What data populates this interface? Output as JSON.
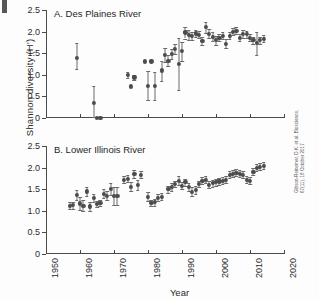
{
  "figure": {
    "ylabel": "Shannon diversity (H')",
    "xlabel": "Year",
    "citation_line1": "Gibson-Reinemer, D.K. et al. Bioscience,",
    "citation_line2": "67(11), 18 October 2017"
  },
  "chart_data": {
    "type": "scatter",
    "title": "",
    "xlabel": "Year",
    "ylabel": "Shannon diversity (H')",
    "xlim": [
      1950,
      2020
    ],
    "ylim": [
      0,
      2.5
    ],
    "xticks": [
      1950,
      1960,
      1970,
      1980,
      1990,
      2000,
      2010,
      2020
    ],
    "xtick_labels": [
      "1950",
      "1960",
      "1970",
      "1980",
      "1990",
      "2000",
      "2010",
      "2020"
    ],
    "yticks": [
      0,
      0.5,
      1.0,
      1.5,
      2.0,
      2.5
    ],
    "ytick_labels": [
      "0",
      "0.5",
      "1.0",
      "1.5",
      "2.0",
      "2.5"
    ],
    "grid": false,
    "legend": "none",
    "error_bars": "vertical, 95% interval",
    "panels": [
      {
        "id": "A",
        "label": "A. Des Plaines River",
        "points": [
          {
            "x": 1959,
            "y": 1.4,
            "lo": 1.13,
            "hi": 1.73
          },
          {
            "x": 1964,
            "y": 0.34,
            "lo": 0.02,
            "hi": 0.74
          },
          {
            "x": 1965,
            "y": 0.01,
            "lo": 0.01,
            "hi": 0.01
          },
          {
            "x": 1966,
            "y": 0.01,
            "lo": 0.01,
            "hi": 0.01
          },
          {
            "x": 1974,
            "y": 1.0,
            "lo": 0.93,
            "hi": 1.07
          },
          {
            "x": 1975,
            "y": 0.73,
            "lo": 0.73,
            "hi": 0.73
          },
          {
            "x": 1976,
            "y": 0.94,
            "lo": 0.88,
            "hi": 1.0
          },
          {
            "x": 1979,
            "y": 1.31,
            "lo": 1.31,
            "hi": 1.31
          },
          {
            "x": 1980,
            "y": 0.75,
            "lo": 0.41,
            "hi": 1.09
          },
          {
            "x": 1981,
            "y": 1.31,
            "lo": 1.31,
            "hi": 1.31
          },
          {
            "x": 1982,
            "y": 0.74,
            "lo": 0.42,
            "hi": 1.06
          },
          {
            "x": 1984,
            "y": 1.1,
            "lo": 0.85,
            "hi": 1.33
          },
          {
            "x": 1985,
            "y": 1.46,
            "lo": 1.3,
            "hi": 1.62
          },
          {
            "x": 1986,
            "y": 1.33,
            "lo": 1.2,
            "hi": 1.46
          },
          {
            "x": 1987,
            "y": 1.48,
            "lo": 1.36,
            "hi": 1.6
          },
          {
            "x": 1988,
            "y": 1.6,
            "lo": 1.48,
            "hi": 1.72
          },
          {
            "x": 1989,
            "y": 1.25,
            "lo": 0.65,
            "hi": 1.85
          },
          {
            "x": 1990,
            "y": 1.55,
            "lo": 1.33,
            "hi": 1.77
          },
          {
            "x": 1991,
            "y": 1.98,
            "lo": 1.84,
            "hi": 2.1
          },
          {
            "x": 1992,
            "y": 1.92,
            "lo": 1.8,
            "hi": 2.03
          },
          {
            "x": 1993,
            "y": 1.9,
            "lo": 1.8,
            "hi": 2.0
          },
          {
            "x": 1994,
            "y": 1.96,
            "lo": 1.88,
            "hi": 2.04
          },
          {
            "x": 1995,
            "y": 1.93,
            "lo": 1.85,
            "hi": 2.01
          },
          {
            "x": 1996,
            "y": 1.78,
            "lo": 1.68,
            "hi": 1.88
          },
          {
            "x": 1997,
            "y": 2.1,
            "lo": 1.96,
            "hi": 2.22
          },
          {
            "x": 1998,
            "y": 1.95,
            "lo": 1.85,
            "hi": 2.05
          },
          {
            "x": 1999,
            "y": 1.88,
            "lo": 1.78,
            "hi": 1.98
          },
          {
            "x": 2000,
            "y": 1.8,
            "lo": 1.7,
            "hi": 1.9
          },
          {
            "x": 2001,
            "y": 1.86,
            "lo": 1.78,
            "hi": 1.94
          },
          {
            "x": 2002,
            "y": 1.9,
            "lo": 1.82,
            "hi": 1.98
          },
          {
            "x": 2003,
            "y": 1.72,
            "lo": 1.62,
            "hi": 1.82
          },
          {
            "x": 2004,
            "y": 1.9,
            "lo": 1.82,
            "hi": 1.98
          },
          {
            "x": 2005,
            "y": 2.0,
            "lo": 1.92,
            "hi": 2.08
          },
          {
            "x": 2006,
            "y": 2.02,
            "lo": 1.94,
            "hi": 2.1
          },
          {
            "x": 2007,
            "y": 1.86,
            "lo": 1.78,
            "hi": 1.94
          },
          {
            "x": 2008,
            "y": 1.95,
            "lo": 1.86,
            "hi": 2.04
          },
          {
            "x": 2009,
            "y": 1.94,
            "lo": 1.86,
            "hi": 2.02
          },
          {
            "x": 2010,
            "y": 1.86,
            "lo": 1.78,
            "hi": 1.94
          },
          {
            "x": 2011,
            "y": 1.8,
            "lo": 1.72,
            "hi": 1.88
          },
          {
            "x": 2012,
            "y": 1.74,
            "lo": 1.45,
            "hi": 2.0
          },
          {
            "x": 2013,
            "y": 1.8,
            "lo": 1.72,
            "hi": 1.88
          },
          {
            "x": 2014,
            "y": 1.84,
            "lo": 1.76,
            "hi": 1.92
          }
        ]
      },
      {
        "id": "B",
        "label": "B. Lower Illinois River",
        "points": [
          {
            "x": 1957,
            "y": 1.12,
            "lo": 1.04,
            "hi": 1.2
          },
          {
            "x": 1958,
            "y": 1.13,
            "lo": 1.05,
            "hi": 1.21
          },
          {
            "x": 1959,
            "y": 1.36,
            "lo": 1.24,
            "hi": 1.48
          },
          {
            "x": 1960,
            "y": 1.17,
            "lo": 1.02,
            "hi": 1.32
          },
          {
            "x": 1961,
            "y": 1.12,
            "lo": 1.0,
            "hi": 1.24
          },
          {
            "x": 1962,
            "y": 1.45,
            "lo": 1.34,
            "hi": 1.56
          },
          {
            "x": 1963,
            "y": 1.1,
            "lo": 1.0,
            "hi": 1.2
          },
          {
            "x": 1964,
            "y": 1.3,
            "lo": 1.2,
            "hi": 1.4
          },
          {
            "x": 1965,
            "y": 1.16,
            "lo": 1.09,
            "hi": 1.23
          },
          {
            "x": 1966,
            "y": 1.18,
            "lo": 1.1,
            "hi": 1.26
          },
          {
            "x": 1967,
            "y": 1.4,
            "lo": 1.3,
            "hi": 1.5
          },
          {
            "x": 1968,
            "y": 1.35,
            "lo": 1.24,
            "hi": 1.46
          },
          {
            "x": 1969,
            "y": 1.5,
            "lo": 1.36,
            "hi": 1.64
          },
          {
            "x": 1970,
            "y": 1.35,
            "lo": 1.14,
            "hi": 1.56
          },
          {
            "x": 1971,
            "y": 1.35,
            "lo": 1.14,
            "hi": 1.56
          },
          {
            "x": 1973,
            "y": 1.72,
            "lo": 1.64,
            "hi": 1.8
          },
          {
            "x": 1974,
            "y": 1.74,
            "lo": 1.66,
            "hi": 1.82
          },
          {
            "x": 1975,
            "y": 1.56,
            "lo": 1.46,
            "hi": 1.66
          },
          {
            "x": 1976,
            "y": 1.85,
            "lo": 1.76,
            "hi": 1.94
          },
          {
            "x": 1977,
            "y": 1.6,
            "lo": 1.48,
            "hi": 1.72
          },
          {
            "x": 1978,
            "y": 1.84,
            "lo": 1.76,
            "hi": 1.92
          },
          {
            "x": 1980,
            "y": 1.33,
            "lo": 1.22,
            "hi": 1.44
          },
          {
            "x": 1981,
            "y": 1.18,
            "lo": 1.1,
            "hi": 1.26
          },
          {
            "x": 1982,
            "y": 1.2,
            "lo": 1.12,
            "hi": 1.28
          },
          {
            "x": 1983,
            "y": 1.3,
            "lo": 1.22,
            "hi": 1.38
          },
          {
            "x": 1984,
            "y": 1.33,
            "lo": 1.25,
            "hi": 1.41
          },
          {
            "x": 1986,
            "y": 1.5,
            "lo": 1.42,
            "hi": 1.58
          },
          {
            "x": 1987,
            "y": 1.55,
            "lo": 1.46,
            "hi": 1.64
          },
          {
            "x": 1988,
            "y": 1.62,
            "lo": 1.54,
            "hi": 1.7
          },
          {
            "x": 1989,
            "y": 1.7,
            "lo": 1.6,
            "hi": 1.8
          },
          {
            "x": 1990,
            "y": 1.58,
            "lo": 1.5,
            "hi": 1.66
          },
          {
            "x": 1991,
            "y": 1.66,
            "lo": 1.58,
            "hi": 1.74
          },
          {
            "x": 1992,
            "y": 1.55,
            "lo": 1.46,
            "hi": 1.64
          },
          {
            "x": 1993,
            "y": 1.44,
            "lo": 1.34,
            "hi": 1.54
          },
          {
            "x": 1994,
            "y": 1.48,
            "lo": 1.38,
            "hi": 1.58
          },
          {
            "x": 1995,
            "y": 1.62,
            "lo": 1.54,
            "hi": 1.7
          },
          {
            "x": 1996,
            "y": 1.7,
            "lo": 1.62,
            "hi": 1.78
          },
          {
            "x": 1997,
            "y": 1.72,
            "lo": 1.64,
            "hi": 1.8
          },
          {
            "x": 1998,
            "y": 1.6,
            "lo": 1.52,
            "hi": 1.68
          },
          {
            "x": 1999,
            "y": 1.64,
            "lo": 1.56,
            "hi": 1.72
          },
          {
            "x": 2000,
            "y": 1.66,
            "lo": 1.58,
            "hi": 1.74
          },
          {
            "x": 2001,
            "y": 1.68,
            "lo": 1.6,
            "hi": 1.76
          },
          {
            "x": 2002,
            "y": 1.7,
            "lo": 1.62,
            "hi": 1.78
          },
          {
            "x": 2003,
            "y": 1.72,
            "lo": 1.64,
            "hi": 1.8
          },
          {
            "x": 2004,
            "y": 1.84,
            "lo": 1.76,
            "hi": 1.92
          },
          {
            "x": 2005,
            "y": 1.86,
            "lo": 1.78,
            "hi": 1.94
          },
          {
            "x": 2006,
            "y": 1.88,
            "lo": 1.8,
            "hi": 1.96
          },
          {
            "x": 2007,
            "y": 1.86,
            "lo": 1.78,
            "hi": 1.94
          },
          {
            "x": 2008,
            "y": 1.84,
            "lo": 1.76,
            "hi": 1.92
          },
          {
            "x": 2009,
            "y": 1.72,
            "lo": 1.64,
            "hi": 1.8
          },
          {
            "x": 2010,
            "y": 1.7,
            "lo": 1.62,
            "hi": 1.78
          },
          {
            "x": 2011,
            "y": 1.9,
            "lo": 1.82,
            "hi": 1.98
          },
          {
            "x": 2012,
            "y": 2.0,
            "lo": 1.92,
            "hi": 2.08
          },
          {
            "x": 2013,
            "y": 2.02,
            "lo": 1.94,
            "hi": 2.1
          },
          {
            "x": 2014,
            "y": 2.04,
            "lo": 1.96,
            "hi": 2.12
          }
        ]
      }
    ]
  }
}
